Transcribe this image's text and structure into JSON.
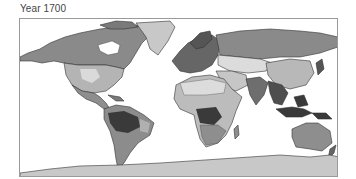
{
  "figure": {
    "title": "Year 1700",
    "type": "choropleth world map (grayscale)",
    "projection": "equirectangular",
    "palette": {
      "ocean": "#ffffff",
      "ice": "#c8c8c8",
      "very_light": "#dcdcdc",
      "light": "#b8b8b8",
      "medium": "#909090",
      "dark": "#666666",
      "very_dark": "#3a3a3a",
      "border": "#333333",
      "frame": "#9a9a9a"
    },
    "regions": [
      {
        "name": "Greenland",
        "shade": "ice"
      },
      {
        "name": "Antarctica",
        "shade": "ice"
      },
      {
        "name": "Canada / Alaska",
        "shade": "medium"
      },
      {
        "name": "United States",
        "shade": "light"
      },
      {
        "name": "Central America",
        "shade": "medium"
      },
      {
        "name": "Amazon basin",
        "shade": "very_dark"
      },
      {
        "name": "South America (rest)",
        "shade": "medium"
      },
      {
        "name": "Europe",
        "shade": "dark"
      },
      {
        "name": "Siberia / Russia",
        "shade": "medium"
      },
      {
        "name": "Central Asia",
        "shade": "very_light"
      },
      {
        "name": "China",
        "shade": "light"
      },
      {
        "name": "India / SE Asia",
        "shade": "dark"
      },
      {
        "name": "Indonesia",
        "shade": "very_dark"
      },
      {
        "name": "North Africa / Sahara",
        "shade": "very_light"
      },
      {
        "name": "Central Africa / Congo",
        "shade": "very_dark"
      },
      {
        "name": "Southern Africa",
        "shade": "medium"
      },
      {
        "name": "Madagascar",
        "shade": "medium"
      },
      {
        "name": "Australia",
        "shade": "medium"
      },
      {
        "name": "New Zealand",
        "shade": "dark"
      }
    ]
  }
}
